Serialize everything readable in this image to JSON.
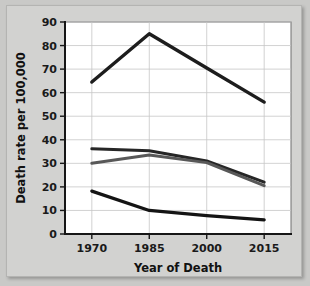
{
  "chart_data": {
    "type": "line",
    "title": "",
    "xlabel": "Year of Death",
    "ylabel": "Death rate per 100,000",
    "categories": [
      1970,
      1985,
      2000,
      2015
    ],
    "x": [
      1970,
      1985,
      2000,
      2015
    ],
    "xlim": [
      1963,
      2022
    ],
    "ylim": [
      0,
      90
    ],
    "ytick_labels": [
      "0",
      "10",
      "20",
      "30",
      "40",
      "50",
      "60",
      "70",
      "80",
      "90"
    ],
    "ytick_values": [
      0,
      10,
      20,
      30,
      40,
      50,
      60,
      70,
      80,
      90
    ],
    "xtick_labels": [
      "1970",
      "1985",
      "2000",
      "2015"
    ],
    "grid": true,
    "legend": false,
    "legend_position": "none",
    "series": [
      {
        "name": "series-top",
        "color": "#1d1d1d",
        "width": 3.4,
        "values": [
          64.5,
          85.0,
          70.5,
          56.0
        ]
      },
      {
        "name": "series-upper-middle",
        "color": "#262626",
        "width": 3.0,
        "values": [
          36.2,
          35.3,
          31.0,
          22.0
        ]
      },
      {
        "name": "series-lower-middle",
        "color": "#585858",
        "width": 3.0,
        "values": [
          30.0,
          33.5,
          30.3,
          20.5
        ]
      },
      {
        "name": "series-bottom",
        "color": "#141414",
        "width": 3.2,
        "values": [
          18.2,
          10.0,
          7.8,
          6.0
        ]
      }
    ]
  }
}
